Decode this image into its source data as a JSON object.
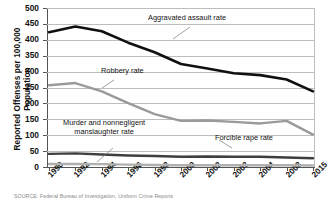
{
  "axes": {
    "ylabel_line1": "Reported Offenses per 100,000",
    "ylabel_line2": "Population",
    "yticks": [
      "0",
      "50",
      "100",
      "150",
      "200",
      "250",
      "300",
      "350",
      "400",
      "450",
      "500"
    ],
    "xticks": [
      "1990",
      "1992",
      "1994",
      "1996",
      "1998",
      "2000",
      "2002",
      "2003",
      "2004",
      "2008",
      "2015"
    ]
  },
  "annotations": {
    "aggravated": "Aggravated assault rate",
    "robbery": "Robbery rate",
    "murder_line1": "Murder and nonnegligent",
    "murder_line2": "manslaughter rate",
    "rape": "Forcible rape rate"
  },
  "colors": {
    "aggravated": "#101010",
    "robbery": "#9a9a9a",
    "rape": "#3f3f3f",
    "murder": "#b0b0b0",
    "grid": "#bdbdbd",
    "axis": "#555555"
  },
  "source": "SOURCE: Federal Bureau of Investigation, Uniform Crime Reports",
  "chart_data": {
    "type": "line",
    "title": "",
    "xlabel": "",
    "ylabel": "Reported Offenses per 100,000 Population",
    "ylim": [
      0,
      500
    ],
    "ytick_step": 50,
    "grid": true,
    "legend": "inline-annotations",
    "categories": [
      "1990",
      "1992",
      "1994",
      "1996",
      "1998",
      "2000",
      "2002",
      "2003",
      "2004",
      "2008",
      "2015"
    ],
    "series": [
      {
        "name": "Aggravated assault rate",
        "color": "#101010",
        "values": [
          424,
          442,
          427,
          391,
          361,
          324,
          310,
          295,
          289,
          275,
          238
        ]
      },
      {
        "name": "Robbery rate",
        "color": "#9a9a9a",
        "values": [
          257,
          264,
          238,
          201,
          166,
          145,
          146,
          142,
          137,
          145,
          102
        ]
      },
      {
        "name": "Forcible rape rate",
        "color": "#3f3f3f",
        "values": [
          41.2,
          42.8,
          39.3,
          36.3,
          34.5,
          32.0,
          33.1,
          32.3,
          32.4,
          29.8,
          27.3
        ]
      },
      {
        "name": "Murder and nonnegligent manslaughter rate",
        "color": "#b0b0b0",
        "values": [
          9.4,
          9.3,
          9.0,
          7.4,
          6.3,
          5.5,
          5.6,
          5.7,
          5.5,
          5.4,
          4.9
        ]
      }
    ]
  }
}
